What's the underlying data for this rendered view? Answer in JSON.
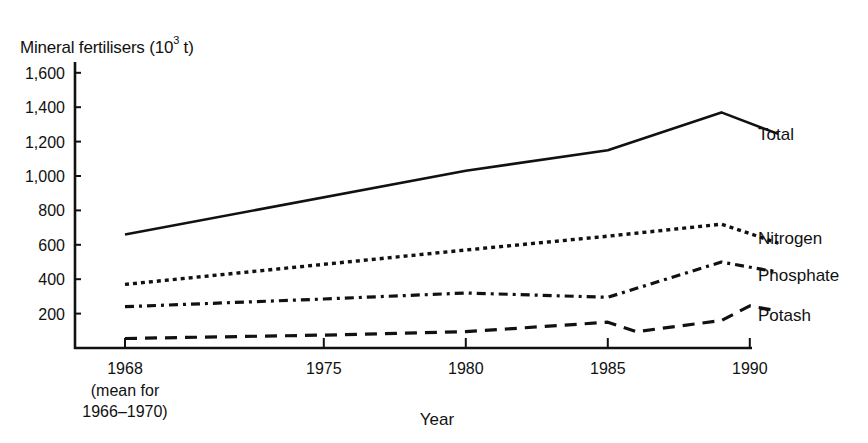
{
  "chart_data": {
    "type": "line",
    "title": "",
    "ylabel": "Mineral fertilisers (10^3 t)",
    "ylabel_parts": {
      "main": "Mineral fertilisers (10",
      "sup": "3",
      "tail": " t)"
    },
    "xlabel": "Year",
    "ylim": [
      0,
      1600
    ],
    "xlim": [
      1964.2,
      1991.2
    ],
    "y_ticks": [
      200,
      400,
      600,
      800,
      1000,
      1200,
      1400,
      1600
    ],
    "y_tick_labels": [
      "200",
      "400",
      "600",
      "800",
      "1,000",
      "1,200",
      "1,400",
      "1,600"
    ],
    "x_ticks": [
      1968,
      1975,
      1980,
      1985,
      1990
    ],
    "x_tick_labels": [
      "1968",
      "1975",
      "1980",
      "1985",
      "1990"
    ],
    "x_tick_note": [
      "(mean for",
      "1966–1970)"
    ],
    "grid": false,
    "legend": "inline labels at line ends (right)",
    "series": [
      {
        "name": "Total",
        "style": "solid",
        "x": [
          1968,
          1980,
          1985,
          1989,
          1991
        ],
        "values": [
          660,
          1030,
          1150,
          1370,
          1245
        ]
      },
      {
        "name": "Nitrogen",
        "style": "dotted",
        "x": [
          1968,
          1980,
          1985,
          1989,
          1991
        ],
        "values": [
          370,
          570,
          650,
          720,
          610
        ]
      },
      {
        "name": "Phosphate",
        "style": "dash-dot",
        "x": [
          1968,
          1975,
          1980,
          1985,
          1989,
          1991
        ],
        "values": [
          240,
          285,
          320,
          295,
          500,
          440
        ]
      },
      {
        "name": "Potash",
        "style": "dashed",
        "x": [
          1968,
          1975,
          1980,
          1985,
          1986,
          1989,
          1990,
          1991
        ],
        "values": [
          55,
          75,
          95,
          150,
          95,
          160,
          245,
          215
        ]
      }
    ]
  }
}
